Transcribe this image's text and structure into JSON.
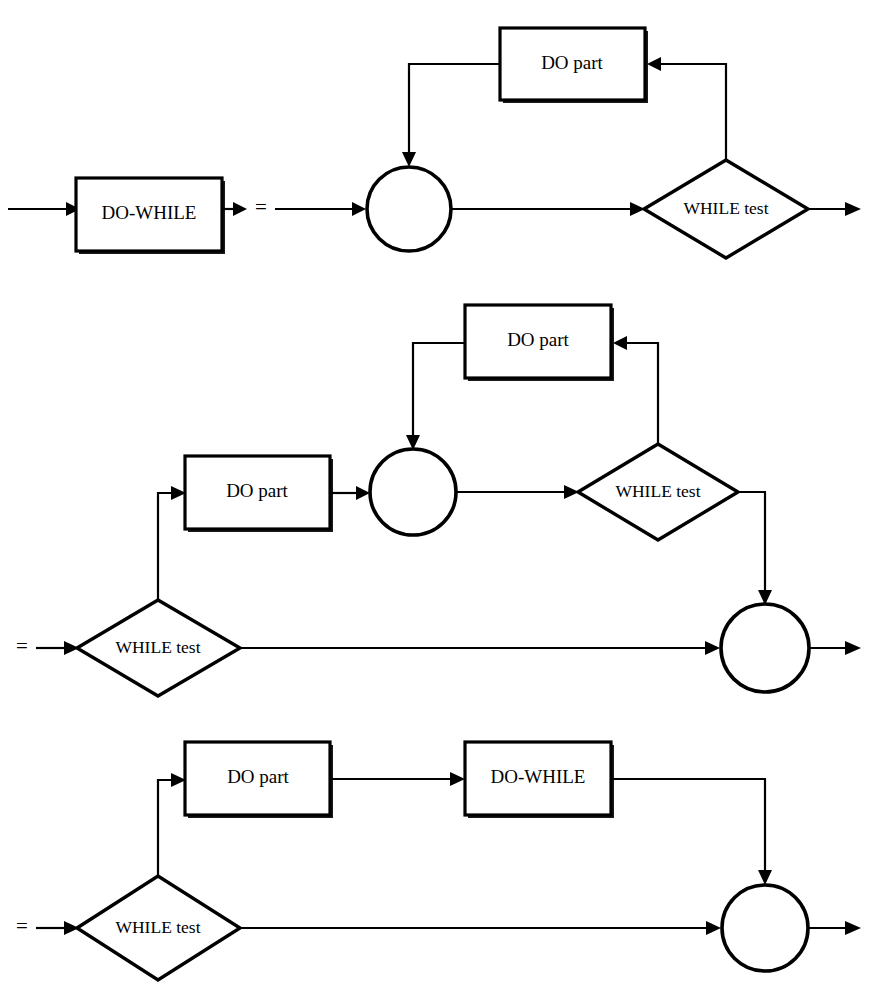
{
  "figure": {
    "type": "flowchart",
    "background_color": "#ffffff",
    "line_color": "#000000",
    "rows": [
      {
        "id": "row-1",
        "equals_sign": "=",
        "nodes": [
          {
            "id": "r1-do-while",
            "shape": "process-box",
            "label": "DO-WHILE"
          },
          {
            "id": "r1-junction",
            "shape": "circle",
            "label": ""
          },
          {
            "id": "r1-do-part",
            "shape": "process-box",
            "label": "DO part"
          },
          {
            "id": "r1-while-test",
            "shape": "decision-diamond",
            "label": "WHILE test"
          }
        ]
      },
      {
        "id": "row-2",
        "equals_sign": "=",
        "nodes": [
          {
            "id": "r2-do-part-top",
            "shape": "process-box",
            "label": "DO part"
          },
          {
            "id": "r2-do-part-left",
            "shape": "process-box",
            "label": "DO part"
          },
          {
            "id": "r2-junction-mid",
            "shape": "circle",
            "label": ""
          },
          {
            "id": "r2-while-test-top",
            "shape": "decision-diamond",
            "label": "WHILE test"
          },
          {
            "id": "r2-while-test-bottom",
            "shape": "decision-diamond",
            "label": "WHILE test"
          },
          {
            "id": "r2-junction-right",
            "shape": "circle",
            "label": ""
          }
        ]
      },
      {
        "id": "row-3",
        "equals_sign": "=",
        "nodes": [
          {
            "id": "r3-do-part",
            "shape": "process-box",
            "label": "DO part"
          },
          {
            "id": "r3-do-while",
            "shape": "process-box",
            "label": "DO-WHILE"
          },
          {
            "id": "r3-while-test",
            "shape": "decision-diamond",
            "label": "WHILE test"
          },
          {
            "id": "r3-junction-right",
            "shape": "circle",
            "label": ""
          }
        ]
      }
    ]
  }
}
